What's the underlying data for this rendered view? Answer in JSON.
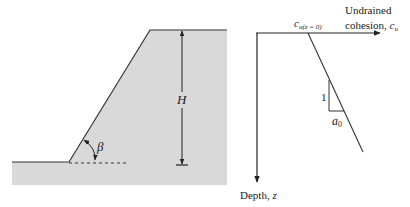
{
  "figure": {
    "slope": {
      "height_label": "H",
      "angle_label": "β",
      "fill_color": "#d9d9d9",
      "line_color": "#333333"
    },
    "strength_profile": {
      "x_axis_label_line1": "Undrained",
      "x_axis_label_line2": "cohesion, ",
      "x_axis_symbol": "c",
      "x_axis_symbol_sub": "u",
      "y_axis_label": "Depth, ",
      "y_axis_symbol": "z",
      "intercept_symbol": "c",
      "intercept_sub": "u(z = 0)",
      "slope_vertical_label": "1",
      "slope_horizontal_symbol": "a",
      "slope_horizontal_sub": "0"
    }
  }
}
